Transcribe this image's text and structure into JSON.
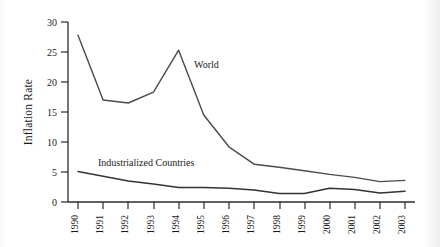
{
  "chart_data": {
    "type": "line",
    "title": "",
    "subtitle": "",
    "xlabel": "",
    "ylabel": "Inflation Rate",
    "x": [
      1990,
      1991,
      1992,
      1993,
      1994,
      1995,
      1996,
      1997,
      1998,
      1999,
      2000,
      2001,
      2002,
      2003
    ],
    "categories": [
      "1990",
      "1991",
      "1992",
      "1993",
      "1994",
      "1995",
      "1996",
      "1997",
      "1998",
      "1999",
      "2000",
      "2001",
      "2002",
      "2003"
    ],
    "xlim": [
      1990,
      2003
    ],
    "ylim": [
      0,
      30
    ],
    "yticks": [
      0,
      5,
      10,
      15,
      20,
      25,
      30
    ],
    "ytick_labels": [
      "0",
      "5",
      "10",
      "15",
      "20",
      "25",
      "30"
    ],
    "grid": false,
    "legend_position": "inline-annotation",
    "series": [
      {
        "name": "World",
        "color": "#4a4a4a",
        "annotation": "World",
        "values": [
          27.8,
          17.0,
          16.5,
          18.3,
          25.3,
          14.5,
          9.2,
          6.3,
          5.8,
          5.2,
          4.6,
          4.1,
          3.4,
          3.6
        ]
      },
      {
        "name": "Industrialized Countries",
        "color": "#333333",
        "annotation": "Industrialized Countries",
        "values": [
          5.1,
          4.3,
          3.5,
          3.0,
          2.4,
          2.4,
          2.3,
          2.0,
          1.4,
          1.4,
          2.3,
          2.1,
          1.5,
          1.8
        ]
      }
    ],
    "annotations": [
      {
        "text": "World",
        "x": 1995.1,
        "y": 21.0
      },
      {
        "text": "Industrialized Countries",
        "x": 1991.6,
        "y": 5.9
      }
    ]
  }
}
